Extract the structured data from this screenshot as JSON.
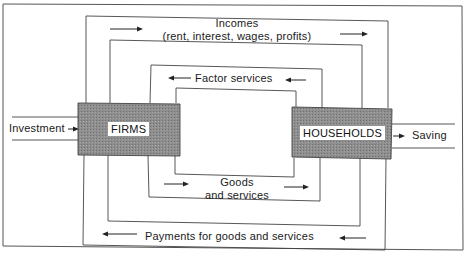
{
  "diagram": {
    "nodes": {
      "firms": "FIRMS",
      "households": "HOUSEHOLDS"
    },
    "flows": {
      "incomes_line1": "Incomes",
      "incomes_line2": "(rent, interest, wages, profits)",
      "factor_services": "Factor services",
      "goods_line1": "Goods",
      "goods_line2": "and services",
      "payments": "Payments for goods and services",
      "investment": "Investment",
      "saving": "Saving"
    },
    "colors": {
      "box_fill": "#8a8a8a",
      "line": "#333333"
    }
  }
}
